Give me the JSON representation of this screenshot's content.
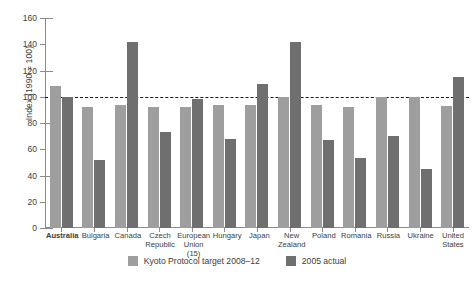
{
  "chart_data": {
    "type": "bar",
    "title": "",
    "xlabel": "",
    "ylabel": "Index (1990 = 100)",
    "ylim": [
      0,
      160
    ],
    "yticks": [
      0,
      20,
      40,
      60,
      80,
      100,
      120,
      140,
      160
    ],
    "grid": false,
    "legend_position": "bottom",
    "reference_line": {
      "value": 100,
      "style": "dashed",
      "color": "#1b1b1b"
    },
    "categories": [
      "Australia",
      "Bulgaria",
      "Canada",
      "Czech\nRepublic",
      "European\nUnion (15)",
      "Hungary",
      "Japan",
      "New\nZealand",
      "Poland",
      "Romania",
      "Russia",
      "Ukraine",
      "United\nStates"
    ],
    "highlight_category": "Australia",
    "series": [
      {
        "name": "Kyoto Protocol target 2008-12",
        "color": "#9e9e9e",
        "values": [
          108,
          92,
          94,
          92,
          92,
          94,
          94,
          100,
          94,
          92,
          100,
          100,
          93
        ]
      },
      {
        "name": "2005 actual",
        "color": "#6f6f6f",
        "values": [
          100,
          52,
          142,
          73,
          98,
          68,
          110,
          142,
          67,
          53,
          70,
          45,
          115
        ]
      }
    ]
  },
  "legend": {
    "items": [
      {
        "label": "Kyoto Protocol target 2008–12",
        "swatch": "target"
      },
      {
        "label": "2005 actual",
        "swatch": "actual"
      }
    ]
  }
}
